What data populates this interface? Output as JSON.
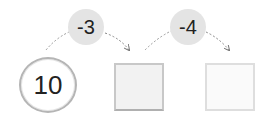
{
  "diagram": {
    "start_value": "10",
    "steps": [
      {
        "operation": "-3",
        "answer": ""
      },
      {
        "operation": "-4",
        "answer": ""
      }
    ],
    "colors": {
      "circle_border": "#b5b5b5",
      "bubble_fill": "#e4e4e4",
      "box_border": "#c8c8c8",
      "arrow": "#888888"
    }
  }
}
